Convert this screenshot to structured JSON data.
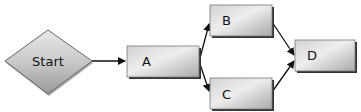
{
  "diagram": {
    "type": "flowchart",
    "nodes": [
      {
        "id": "start",
        "label": "Start",
        "shape": "diamond"
      },
      {
        "id": "a",
        "label": "A",
        "shape": "rect"
      },
      {
        "id": "b",
        "label": "B",
        "shape": "rect"
      },
      {
        "id": "c",
        "label": "C",
        "shape": "rect"
      },
      {
        "id": "d",
        "label": "D",
        "shape": "rect"
      }
    ],
    "edges": [
      {
        "from": "start",
        "to": "a"
      },
      {
        "from": "a",
        "to": "b"
      },
      {
        "from": "a",
        "to": "c"
      },
      {
        "from": "b",
        "to": "d"
      },
      {
        "from": "c",
        "to": "d"
      }
    ],
    "colors": {
      "fill_light": "#e6e6e6",
      "fill_dark": "#a8a8a8",
      "stroke": "#555555",
      "shadow": "#333333",
      "arrow": "#111111"
    }
  }
}
